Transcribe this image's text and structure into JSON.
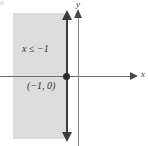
{
  "figure": {
    "number_label": "8.",
    "background_color": "#ffffff"
  },
  "axes": {
    "x_label": "x",
    "y_label": "y",
    "axis_color": "#6d6d6d",
    "arrow_color": "#4a4a4a"
  },
  "region": {
    "shade_color": "#dddddd",
    "inequality_label": "x ≤ −1"
  },
  "boundary": {
    "line_color": "#3c3c3c",
    "line_style": "solid",
    "point_label": "(−1, 0)",
    "point_color": "#2b2b2b"
  },
  "chart_data": {
    "type": "area",
    "title": "",
    "xlabel": "x",
    "ylabel": "y",
    "grid": false,
    "legend": "none",
    "inequality": "x ≤ −1",
    "boundary_type": "solid",
    "boundary_x": -1,
    "shaded_side": "left",
    "marked_points": [
      {
        "label": "(−1, 0)",
        "x": -1,
        "y": 0,
        "filled": true
      }
    ],
    "annotations": [
      "x ≤ −1",
      "(−1, 0)"
    ]
  }
}
